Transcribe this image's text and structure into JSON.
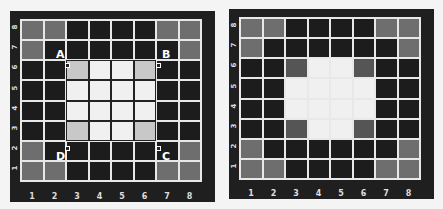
{
  "boards": [
    {
      "id": "left",
      "files": [
        "1",
        "2",
        "3",
        "4",
        "5",
        "6",
        "7",
        "8"
      ],
      "ranks": [
        "8",
        "7",
        "6",
        "5",
        "4",
        "3",
        "2",
        "1"
      ],
      "cells": [
        [
          "g",
          "g",
          "d",
          "d",
          "d",
          "d",
          "g",
          "g"
        ],
        [
          "g",
          "d",
          "d",
          "d",
          "d",
          "d",
          "d",
          "g"
        ],
        [
          "d",
          "d",
          "l",
          "w",
          "w",
          "l",
          "d",
          "d"
        ],
        [
          "d",
          "d",
          "w",
          "w",
          "w",
          "w",
          "d",
          "d"
        ],
        [
          "d",
          "d",
          "w",
          "w",
          "w",
          "w",
          "d",
          "d"
        ],
        [
          "d",
          "d",
          "l",
          "w",
          "w",
          "l",
          "d",
          "d"
        ],
        [
          "g",
          "d",
          "d",
          "d",
          "d",
          "d",
          "d",
          "g"
        ],
        [
          "g",
          "g",
          "d",
          "d",
          "d",
          "d",
          "g",
          "g"
        ]
      ],
      "corner_labels": [
        {
          "text": "A",
          "position": "top-left"
        },
        {
          "text": "B",
          "position": "top-right"
        },
        {
          "text": "C",
          "position": "bottom-right"
        },
        {
          "text": "D",
          "position": "bottom-left"
        }
      ]
    },
    {
      "id": "right",
      "files": [
        "1",
        "2",
        "3",
        "4",
        "5",
        "6",
        "7",
        "8"
      ],
      "ranks": [
        "8",
        "7",
        "6",
        "5",
        "4",
        "3",
        "2",
        "1"
      ],
      "cells": [
        [
          "g",
          "g",
          "d",
          "d",
          "d",
          "d",
          "g",
          "g"
        ],
        [
          "g",
          "d",
          "d",
          "d",
          "d",
          "d",
          "d",
          "g"
        ],
        [
          "d",
          "d",
          "m",
          "w",
          "w",
          "m",
          "d",
          "d"
        ],
        [
          "d",
          "d",
          "w",
          "w",
          "w",
          "w",
          "d",
          "d"
        ],
        [
          "d",
          "d",
          "w",
          "w",
          "w",
          "w",
          "d",
          "d"
        ],
        [
          "d",
          "d",
          "m",
          "w",
          "w",
          "m",
          "d",
          "d"
        ],
        [
          "g",
          "d",
          "d",
          "d",
          "d",
          "d",
          "d",
          "g"
        ],
        [
          "g",
          "g",
          "d",
          "d",
          "d",
          "d",
          "g",
          "g"
        ]
      ]
    }
  ],
  "labels": {
    "A": "A",
    "B": "B",
    "C": "C",
    "D": "D"
  },
  "colors": {
    "dark": "#1c1c1c",
    "gray": "#6e6e6e",
    "mid": "#555555",
    "light": "#c8c8c8",
    "white": "#f0f0f0",
    "frame": "#1f1f1f"
  }
}
